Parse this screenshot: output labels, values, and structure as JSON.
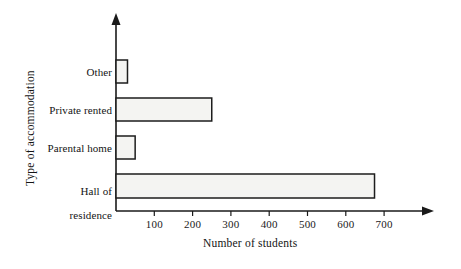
{
  "chart_data": {
    "type": "bar",
    "orientation": "horizontal",
    "title": "",
    "xlabel": "Number of students",
    "ylabel": "Type of accommodation",
    "categories": [
      "Other",
      "Private rented",
      "Parental home",
      "Hall of residence"
    ],
    "category_display": [
      {
        "lines": [
          "Other"
        ]
      },
      {
        "lines": [
          "Private rented"
        ]
      },
      {
        "lines": [
          "Parental home"
        ]
      },
      {
        "lines": [
          "Hall of",
          "residence"
        ]
      }
    ],
    "values": [
      30,
      250,
      50,
      675
    ],
    "xlim": [
      0,
      760
    ],
    "xticks": [
      100,
      200,
      300,
      400,
      500,
      600,
      700
    ],
    "xtick_labels": [
      "100",
      "200",
      "300",
      "400",
      "500",
      "600",
      "700"
    ],
    "grid": false,
    "legend": false,
    "bar_fill_color": "#f4f4f2",
    "bar_edge_color": "#1d1d1d",
    "axis_color": "#1a1a1a"
  }
}
